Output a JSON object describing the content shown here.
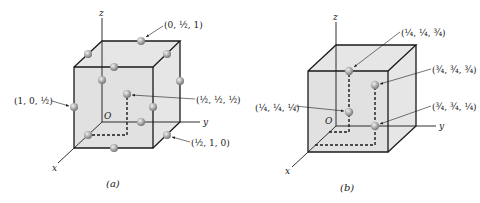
{
  "figure_a": {
    "caption": "(a)",
    "axes": {
      "x": "x",
      "y": "y",
      "z": "z",
      "origin": "O"
    },
    "labels": {
      "top_face": "(0, ½, 1)",
      "left_edge": "(1, 0, ½)",
      "body_center": "(½, ½, ½)",
      "bottom_edge": "(½, 1, 0)"
    }
  },
  "figure_b": {
    "caption": "(b)",
    "axes": {
      "x": "x",
      "y": "y",
      "z": "z",
      "origin": "O"
    },
    "labels": {
      "p1": "(¼, ¼, ¾)",
      "p2": "(¾, ¾, ¾)",
      "p3": "(¼, ¼, ¼)",
      "p4": "(¾, ¾, ¼)"
    }
  },
  "colors": {
    "face": "#e4e4e4",
    "line": "#1a1a1a",
    "sphere": "#9c9c9c"
  }
}
